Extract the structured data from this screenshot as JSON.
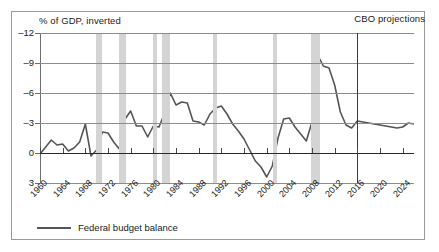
{
  "header": {
    "unit_label": "% of GDP, inverted",
    "projection_label": "CBO projections"
  },
  "legend": {
    "series_label": "Federal budget balance"
  },
  "chart_data": {
    "type": "line",
    "title": "",
    "subtitle": "",
    "xlabel": "",
    "ylabel": "% of GDP, inverted",
    "note": "Y axis is inverted: deficits plotted upward as negative values",
    "grid": true,
    "legend_position": "bottom-left",
    "ylim": [
      3,
      -12
    ],
    "yticks": [
      -12,
      -9,
      -6,
      -3,
      0,
      3
    ],
    "ytick_labels": [
      "–12",
      "–9",
      "–6",
      "–3",
      "0",
      "3"
    ],
    "xlim": [
      1960,
      2026
    ],
    "xticks": [
      1960,
      1964,
      1968,
      1972,
      1976,
      1980,
      1984,
      1988,
      1992,
      1996,
      2000,
      2004,
      2008,
      2012,
      2016,
      2020,
      2024
    ],
    "xtick_labels": [
      "1960",
      "1964",
      "1968",
      "1972",
      "1976",
      "1980",
      "1984",
      "1988",
      "1992",
      "1996",
      "2000",
      "2004",
      "2008",
      "2012",
      "2016",
      "2020",
      "2024"
    ],
    "projection_start_year": 2016,
    "recession_bands": [
      {
        "start": 1969.9,
        "end": 1970.9
      },
      {
        "start": 1973.9,
        "end": 1975.2
      },
      {
        "start": 1980.0,
        "end": 1980.6
      },
      {
        "start": 1981.5,
        "end": 1982.9
      },
      {
        "start": 1990.6,
        "end": 1991.2
      },
      {
        "start": 2001.2,
        "end": 2001.9
      },
      {
        "start": 2007.9,
        "end": 2009.5
      }
    ],
    "series": [
      {
        "name": "Federal budget balance",
        "x": [
          1960,
          1961,
          1962,
          1963,
          1964,
          1965,
          1966,
          1967,
          1968,
          1969,
          1970,
          1971,
          1972,
          1973,
          1974,
          1975,
          1976,
          1977,
          1978,
          1979,
          1980,
          1981,
          1982,
          1983,
          1984,
          1985,
          1986,
          1987,
          1988,
          1989,
          1990,
          1991,
          1992,
          1993,
          1994,
          1995,
          1996,
          1997,
          1998,
          1999,
          2000,
          2001,
          2002,
          2003,
          2004,
          2005,
          2006,
          2007,
          2008,
          2009,
          2010,
          2011,
          2012,
          2013,
          2014,
          2015,
          2016,
          2017,
          2018,
          2019,
          2020,
          2021,
          2022,
          2023,
          2024,
          2025,
          2026
        ],
        "y": [
          0.1,
          -0.6,
          -1.3,
          -0.8,
          -0.9,
          -0.2,
          -0.5,
          -1.1,
          -2.9,
          0.3,
          -0.3,
          -2.1,
          -2.0,
          -1.1,
          -0.4,
          -3.4,
          -4.2,
          -2.7,
          -2.7,
          -1.6,
          -2.7,
          -2.6,
          -4.0,
          -6.0,
          -4.8,
          -5.1,
          -5.0,
          -3.2,
          -3.1,
          -2.8,
          -3.9,
          -4.5,
          -4.7,
          -3.9,
          -2.9,
          -2.2,
          -1.4,
          -0.3,
          0.8,
          1.4,
          2.4,
          1.3,
          -1.5,
          -3.4,
          -3.5,
          -2.6,
          -1.9,
          -1.2,
          -3.1,
          -9.8,
          -8.7,
          -8.5,
          -6.8,
          -4.1,
          -2.8,
          -2.5,
          -3.2,
          -3.1,
          -3.0,
          -2.9,
          -2.8,
          -2.7,
          -2.6,
          -2.5,
          -2.6,
          -3.0,
          -2.9
        ],
        "color": "#555555"
      }
    ]
  },
  "colors": {
    "series_line": "#555555",
    "recession_band": "#d4d4d4",
    "gridline": "#8c8c8c",
    "zero_line": "#2a2a2a",
    "projection_divider": "#3a3a3a",
    "frame_border": "#9a9a9a",
    "text": "#1a1a1a"
  }
}
